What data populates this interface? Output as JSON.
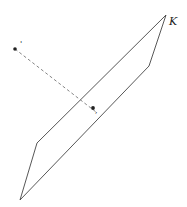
{
  "diagram": {
    "plane_label": "K",
    "plane_vertices": [
      [
        166,
        15
      ],
      [
        149,
        66
      ],
      [
        20,
        200
      ],
      [
        37,
        143
      ]
    ],
    "point_outside": {
      "x": 15,
      "y": 49,
      "mark": "'"
    },
    "point_on_plane": {
      "x": 93,
      "y": 108,
      "mark": ","
    },
    "stroke_color": "#444444",
    "dashed_color": "#777777"
  }
}
